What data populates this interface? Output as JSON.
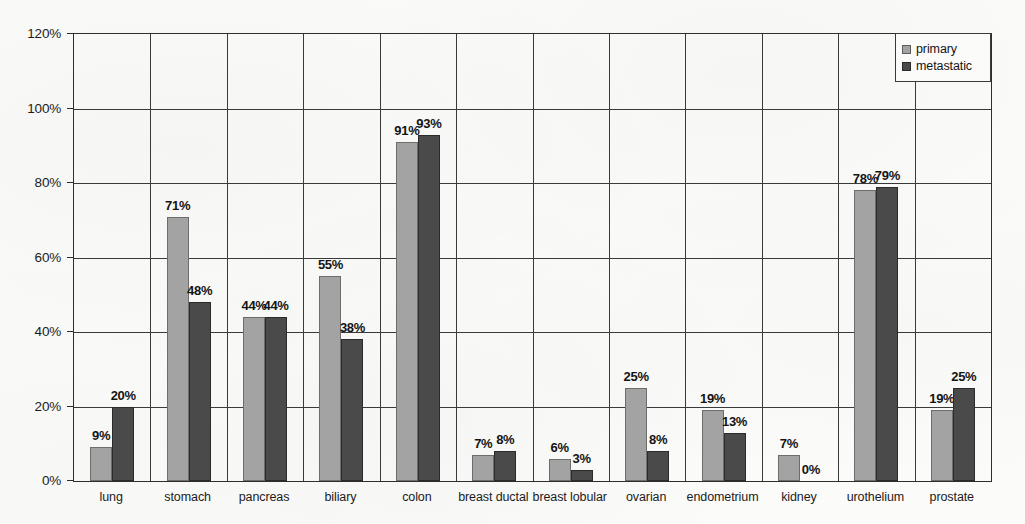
{
  "chart_data": {
    "type": "bar",
    "title": "",
    "subtitle": "",
    "xlabel": "",
    "ylabel": "",
    "ylim": [
      0,
      120
    ],
    "y_tick_labels": [
      "0%",
      "20%",
      "40%",
      "60%",
      "80%",
      "100%",
      "120%"
    ],
    "y_tick_values": [
      0,
      20,
      40,
      60,
      80,
      100,
      120
    ],
    "grid": "horizontal",
    "legend_position": "top-right",
    "value_suffix": "%",
    "categories": [
      "lung",
      "stomach",
      "pancreas",
      "biliary",
      "colon",
      "breast ductal",
      "breast lobular",
      "ovarian",
      "endometrium",
      "kidney",
      "urothelium",
      "prostate"
    ],
    "series": [
      {
        "name": "primary",
        "color": "#a3a3a3",
        "values": [
          9,
          71,
          44,
          55,
          91,
          7,
          6,
          25,
          19,
          7,
          78,
          19
        ],
        "labels": [
          "9%",
          "71%",
          "44%",
          "55%",
          "91%",
          "7%",
          "6%",
          "25%",
          "19%",
          "7%",
          "78%",
          "19%"
        ]
      },
      {
        "name": "metastatic",
        "color": "#4a4a4a",
        "values": [
          20,
          48,
          44,
          38,
          93,
          8,
          3,
          8,
          13,
          0,
          79,
          25
        ],
        "labels": [
          "20%",
          "48%",
          "44%",
          "38%",
          "93%",
          "8%",
          "3%",
          "8%",
          "13%",
          "0%",
          "79%",
          "25%"
        ]
      }
    ]
  },
  "legend": {
    "entries": [
      {
        "label": "primary",
        "color": "#a3a3a3"
      },
      {
        "label": "metastatic",
        "color": "#4a4a4a"
      }
    ]
  },
  "colors": {
    "primary_bar": "#a3a3a3",
    "metastatic_bar": "#4a4a4a",
    "axis": "#2e2e2e",
    "gridline": "#3a3a3a",
    "background": "#fbfbfa",
    "text": "#1c1c1c"
  }
}
